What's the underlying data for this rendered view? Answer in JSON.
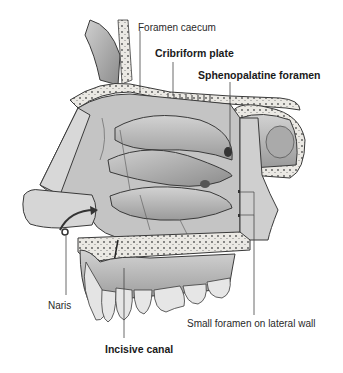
{
  "diagram": {
    "labels": {
      "foramen_caecum": "Foramen caecum",
      "cribriform_plate": "Cribriform plate",
      "sphenopalatine_foramen": "Sphenopalatine foramen",
      "naris": "Naris",
      "small_foramen": "Small foramen on lateral wall",
      "incisive_canal": "Incisive canal"
    },
    "colors": {
      "bone": "#e9e7e2",
      "shadow": "#8f8f8f",
      "tissue": "#bdbdbd",
      "outline": "#3a3a3a",
      "leader": "#444444"
    }
  }
}
